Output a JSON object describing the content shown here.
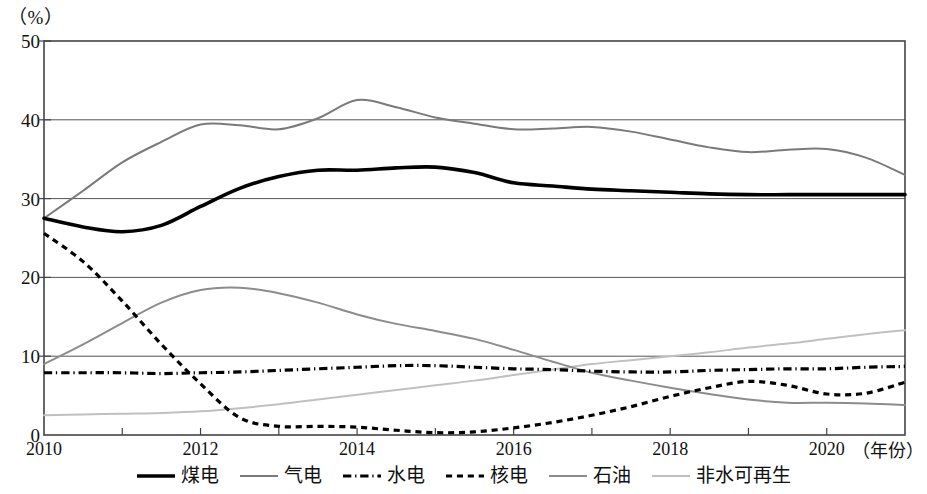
{
  "chart_data": {
    "type": "line",
    "title": "",
    "subtitle": "",
    "xlabel": "年份",
    "ylabel": "%",
    "y_unit_label": "（%）",
    "x_unit_label": "（年份）",
    "xlim": [
      2010,
      2021
    ],
    "ylim": [
      0,
      50
    ],
    "yticks": [
      0,
      10,
      20,
      30,
      40,
      50
    ],
    "xticks": [
      2010,
      2012,
      2014,
      2016,
      2018,
      2020
    ],
    "xtick_labels": [
      "2010",
      "2012",
      "2014",
      "2016",
      "2018",
      "2020"
    ],
    "ytick_labels": [
      "0",
      "10",
      "20",
      "30",
      "40",
      "50"
    ],
    "grid": "horizontal",
    "legend_position": "bottom",
    "x": [
      2010,
      2010.5,
      2011,
      2011.5,
      2012,
      2012.5,
      2013,
      2013.5,
      2014,
      2014.5,
      2015,
      2015.5,
      2016,
      2016.5,
      2017,
      2017.5,
      2018,
      2018.5,
      2019,
      2019.5,
      2020,
      2020.5,
      2021
    ],
    "series": [
      {
        "name": "煤电",
        "key": "coal",
        "color": "#000000",
        "style": "solid",
        "width": 3.6,
        "values": [
          27.5,
          26.4,
          25.8,
          26.6,
          29.0,
          31.3,
          32.8,
          33.6,
          33.6,
          33.9,
          34.0,
          33.3,
          32.0,
          31.6,
          31.2,
          31.0,
          30.8,
          30.6,
          30.5,
          30.5,
          30.5,
          30.5,
          30.5
        ]
      },
      {
        "name": "气电",
        "key": "gas",
        "color": "#7a7a7a",
        "style": "solid",
        "width": 2.0,
        "values": [
          27.5,
          31.0,
          34.6,
          37.2,
          39.4,
          39.3,
          38.8,
          40.2,
          42.5,
          41.6,
          40.3,
          39.5,
          38.8,
          38.9,
          39.1,
          38.5,
          37.5,
          36.5,
          35.9,
          36.2,
          36.3,
          35.2,
          33.0
        ]
      },
      {
        "name": "水电",
        "key": "hydro",
        "color": "#000000",
        "style": "dashdot",
        "width": 3.2,
        "values": [
          7.9,
          7.9,
          7.9,
          7.8,
          7.9,
          8.0,
          8.2,
          8.4,
          8.6,
          8.8,
          8.8,
          8.6,
          8.4,
          8.3,
          8.1,
          8.0,
          8.0,
          8.2,
          8.3,
          8.4,
          8.4,
          8.6,
          8.7
        ]
      },
      {
        "name": "核电",
        "key": "nuclear",
        "color": "#000000",
        "style": "dashed",
        "width": 3.2,
        "values": [
          25.6,
          22.0,
          17.0,
          11.5,
          6.5,
          2.2,
          1.1,
          1.1,
          1.0,
          0.6,
          0.3,
          0.4,
          0.9,
          1.6,
          2.5,
          3.6,
          4.9,
          6.0,
          6.8,
          6.3,
          5.2,
          5.3,
          6.7
        ]
      },
      {
        "name": "石油",
        "key": "oil",
        "color": "#8c8c8c",
        "style": "solid",
        "width": 2.0,
        "values": [
          9.0,
          11.5,
          14.2,
          16.8,
          18.4,
          18.7,
          18.0,
          16.8,
          15.3,
          14.1,
          13.2,
          12.2,
          10.8,
          9.3,
          7.9,
          6.9,
          6.0,
          5.2,
          4.5,
          4.1,
          4.1,
          4.0,
          3.8
        ]
      },
      {
        "name": "非水可再生",
        "key": "nonhydro_renewable",
        "color": "#c0c0c0",
        "style": "solid",
        "width": 2.0,
        "values": [
          2.5,
          2.6,
          2.7,
          2.8,
          3.0,
          3.4,
          3.9,
          4.5,
          5.1,
          5.7,
          6.3,
          6.9,
          7.6,
          8.3,
          9.0,
          9.5,
          10.0,
          10.5,
          11.1,
          11.6,
          12.2,
          12.8,
          13.3
        ]
      }
    ]
  },
  "legend": {
    "items": [
      {
        "label": "煤电"
      },
      {
        "label": "气电"
      },
      {
        "label": "水电"
      },
      {
        "label": "核电"
      },
      {
        "label": "石油"
      },
      {
        "label": "非水可再生"
      }
    ]
  }
}
